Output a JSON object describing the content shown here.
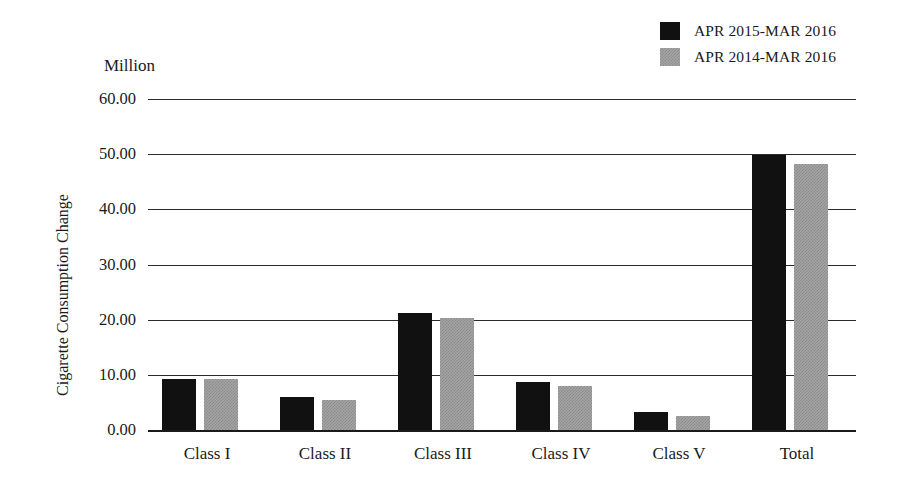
{
  "chart_data": {
    "type": "bar",
    "title": "",
    "subtitle": "",
    "xlabel": "",
    "ylabel": "Cigarette Consumption Change",
    "unit_label": "Million",
    "categories": [
      "Class I",
      "Class II",
      "Class III",
      "Class IV",
      "Class V",
      "Total"
    ],
    "series": [
      {
        "name": "APR 2015-MAR 2016",
        "color": "#111111",
        "values": [
          9.3,
          6.0,
          21.2,
          8.7,
          3.2,
          49.9
        ]
      },
      {
        "name": "APR 2014-MAR 2016",
        "color": "#a5a5a5",
        "values": [
          9.3,
          5.5,
          20.3,
          8.0,
          2.6,
          48.3
        ]
      }
    ],
    "ylim": [
      0,
      60
    ],
    "ytick_values": [
      0,
      10,
      20,
      30,
      40,
      50,
      60
    ],
    "ytick_labels": [
      "0.00",
      "10.00",
      "20.00",
      "30.00",
      "40.00",
      "50.00",
      "60.00"
    ],
    "grid": true,
    "legend_position": "top-right"
  },
  "legend": {
    "entries": [
      {
        "label": "APR 2015-MAR 2016",
        "swatch": "solid-black"
      },
      {
        "label": "APR 2014-MAR 2016",
        "swatch": "dither-gray"
      }
    ]
  }
}
